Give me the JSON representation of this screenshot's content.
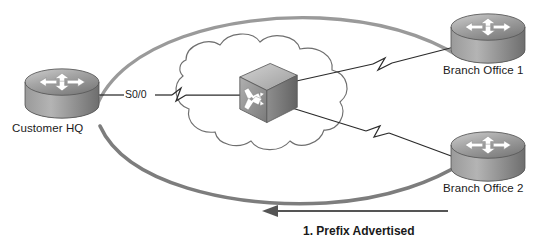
{
  "diagram": {
    "type": "network-topology",
    "background_color": "#ffffff",
    "nodes": [
      {
        "id": "customer-hq",
        "label": "Customer HQ",
        "icon": "router-icon",
        "x": 62,
        "y": 97
      },
      {
        "id": "wan-switch",
        "label": "",
        "icon": "atm-switch-icon",
        "x": 265,
        "y": 95
      },
      {
        "id": "branch-office-1",
        "label": "Branch Office 1",
        "icon": "router-icon",
        "x": 487,
        "y": 37
      },
      {
        "id": "branch-office-2",
        "label": "Branch Office 2",
        "icon": "router-icon",
        "x": 487,
        "y": 155
      }
    ],
    "cloud": {
      "label": "",
      "icon": "network-cloud-icon"
    },
    "links": [
      {
        "id": "hq-to-cloud",
        "interface_label": "S0/0",
        "style": "serial-lightning"
      },
      {
        "id": "switch-to-branch-1",
        "interface_label": "",
        "style": "serial-lightning"
      },
      {
        "id": "switch-to-branch-2",
        "interface_label": "",
        "style": "serial-lightning"
      }
    ],
    "arcs": [
      {
        "id": "upper-arc",
        "color": "#9a9a9a"
      },
      {
        "id": "lower-arc",
        "color": "#7d7d7d"
      }
    ],
    "flow_arrow": {
      "direction": "left",
      "color": "#555555",
      "caption": "1. Prefix Advertised"
    },
    "colors": {
      "device_fill": "#a8a8a8",
      "device_stroke": "#4a4a4a",
      "link_stroke": "#2b2b2b",
      "cloud_stroke": "#6f6f6f",
      "text": "#1a1a1a"
    }
  }
}
